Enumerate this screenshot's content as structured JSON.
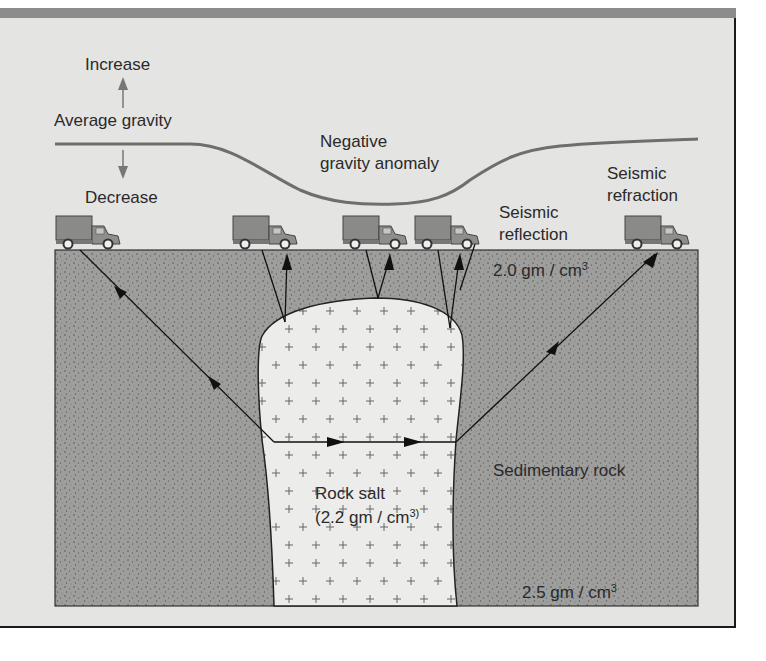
{
  "figure": {
    "gravity_profile": {
      "increase_label": "Increase",
      "average_label": "Average gravity",
      "decrease_label": "Decrease",
      "anomaly_label_line1": "Negative",
      "anomaly_label_line2": "gravity anomaly"
    },
    "methods": {
      "reflection_line1": "Seismic",
      "reflection_line2": "reflection",
      "refraction_line1": "Seismic",
      "refraction_line2": "refraction"
    },
    "layers": {
      "upper_density": "2.0 gm / cm",
      "upper_density_exp": "3",
      "sedimentary_label": "Sedimentary rock",
      "lower_density": "2.5 gm / cm",
      "lower_density_exp": "3",
      "salt_label": "Rock salt",
      "salt_density": "(2.2 gm / cm",
      "salt_density_exp": "3)"
    },
    "trucks": [
      {
        "name": "truck-1",
        "x": 56
      },
      {
        "name": "truck-2",
        "x": 233
      },
      {
        "name": "truck-3",
        "x": 343
      },
      {
        "name": "truck-4",
        "x": 415
      },
      {
        "name": "truck-5",
        "x": 625
      }
    ],
    "colors": {
      "background": "#e4e4e2",
      "sediment": "#9c9c9a",
      "salt": "#ececea",
      "gravity_curve": "#6e6e6e",
      "arrow": "#1a1a1a",
      "truck": "#8a8a88"
    }
  }
}
